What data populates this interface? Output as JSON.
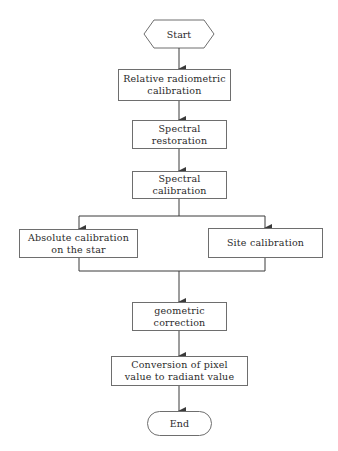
{
  "diagram": {
    "type": "flowchart",
    "colors": {
      "line": "#3a3a3a",
      "border": "#6e6e6e",
      "text": "#2a2a2a",
      "background": "#ffffff"
    },
    "nodes": {
      "start": {
        "label": "Start",
        "shape": "hexagon"
      },
      "relative_radiometric": {
        "label": "Relative radiometric\ncalibration",
        "shape": "rectangle"
      },
      "spectral_restoration": {
        "label": "Spectral\nrestoration",
        "shape": "rectangle"
      },
      "spectral_calibration": {
        "label": "Spectral\ncalibration",
        "shape": "rectangle"
      },
      "absolute_calibration": {
        "label": "Absolute calibration\non the star",
        "shape": "rectangle"
      },
      "site_calibration": {
        "label": "Site calibration",
        "shape": "rectangle"
      },
      "geometric_correction": {
        "label": "geometric\ncorrection",
        "shape": "rectangle"
      },
      "conversion": {
        "label": "Conversion of pixel\nvalue to radiant value",
        "shape": "rectangle"
      },
      "end": {
        "label": "End",
        "shape": "rounded-terminal"
      }
    },
    "edges": [
      [
        "start",
        "relative_radiometric"
      ],
      [
        "relative_radiometric",
        "spectral_restoration"
      ],
      [
        "spectral_restoration",
        "spectral_calibration"
      ],
      [
        "spectral_calibration",
        "absolute_calibration"
      ],
      [
        "spectral_calibration",
        "site_calibration"
      ],
      [
        "absolute_calibration",
        "geometric_correction"
      ],
      [
        "site_calibration",
        "geometric_correction"
      ],
      [
        "geometric_correction",
        "conversion"
      ],
      [
        "conversion",
        "end"
      ]
    ]
  }
}
